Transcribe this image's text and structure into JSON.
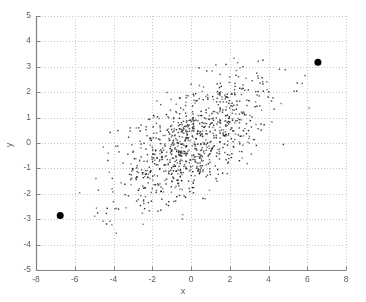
{
  "figure": {
    "type": "scatter-plot",
    "background_color": "#ffffff",
    "plot_area_px": {
      "left": 36,
      "top": 16,
      "right": 346,
      "bottom": 270
    },
    "axis_color": "#808080",
    "grid_color": "#c8c8c8",
    "point_color": "#1a1a1a",
    "highlight_color": "#000000"
  },
  "chart_data": {
    "type": "scatter",
    "title": "",
    "xlabel": "x",
    "ylabel": "y",
    "xlim": [
      -8,
      8
    ],
    "ylim": [
      -5,
      5
    ],
    "xticks": [
      -8,
      -6,
      -4,
      -2,
      0,
      2,
      4,
      6,
      8
    ],
    "yticks": [
      -5,
      -4,
      -3,
      -2,
      -1,
      0,
      1,
      2,
      3,
      4,
      5
    ],
    "xtick_labels": [
      "-8",
      "-6",
      "-4",
      "-2",
      "0",
      "2",
      "4",
      "6",
      "8"
    ],
    "ytick_labels": [
      "-5",
      "-4",
      "-3",
      "-2",
      "-1",
      "0",
      "1",
      "2",
      "3",
      "4",
      "5"
    ],
    "grid": true,
    "grid_style": "dotted",
    "legend": null,
    "marker": {
      "style": "dot",
      "size_px": 1.4
    },
    "n_points": 900,
    "cloud": {
      "description": "dense bivariate-normal cloud, positively correlated",
      "mean_x": 0.0,
      "mean_y": 0.0,
      "std_x": 1.9,
      "std_y": 1.25,
      "correlation": 0.62,
      "seed": 20240517
    },
    "highlighted_points": [
      {
        "x": 6.55,
        "y": 3.18,
        "label": "outlier-upper-right",
        "size_px": 7
      },
      {
        "x": -6.75,
        "y": -2.85,
        "label": "outlier-lower-left",
        "size_px": 7
      }
    ]
  }
}
